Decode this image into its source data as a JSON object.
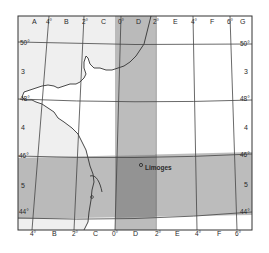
{
  "map": {
    "title": "",
    "colors": {
      "land_outside": "#efefef",
      "land_inside": "#ffffff",
      "band": "#b0b0b0",
      "band_overlap": "#8e8e8e",
      "grid_line": "#444444",
      "coast_line": "#333333",
      "frame": "#333333"
    },
    "top_labels": {
      "col_A": "A",
      "deg_4w": "4°",
      "col_B": "B",
      "deg_2w": "2°",
      "col_C": "C",
      "deg_0": "0°",
      "col_D": "D",
      "deg_2e": "2°",
      "col_E": "E",
      "deg_4e": "4°",
      "col_F": "F",
      "deg_6e": "6°",
      "col_G": "G"
    },
    "bottom_labels": {
      "deg_4w": "4°",
      "col_B": "B",
      "deg_2w": "2°",
      "col_C": "C",
      "deg_0": "0°",
      "col_D": "D",
      "deg_2e": "2°",
      "col_E": "E",
      "deg_4e": "4°",
      "col_F": "F",
      "deg_6e": "6°"
    },
    "left_labels": {
      "lat_50": "50°",
      "row_3": "3",
      "lat_48": "48°",
      "row_4": "4",
      "lat_46": "46°",
      "row_5": "5",
      "lat_44": "44°"
    },
    "right_labels": {
      "lat_50": "50°",
      "row_3": "3",
      "lat_48": "48°",
      "row_4": "4",
      "lat_46": "46°",
      "row_5": "5",
      "lat_44": "44°"
    },
    "city": {
      "name": "Limoges"
    },
    "highlighted_column": "D",
    "highlighted_row": "5"
  }
}
